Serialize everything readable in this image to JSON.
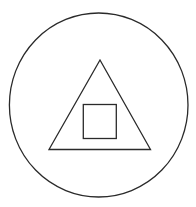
{
  "diagram": {
    "stroke_color": "#2a2a2a",
    "background": "#ffffff",
    "shapes": [
      {
        "type": "circle",
        "name": "outer-circle"
      },
      {
        "type": "triangle",
        "name": "middle-triangle"
      },
      {
        "type": "square",
        "name": "inner-square"
      }
    ]
  }
}
